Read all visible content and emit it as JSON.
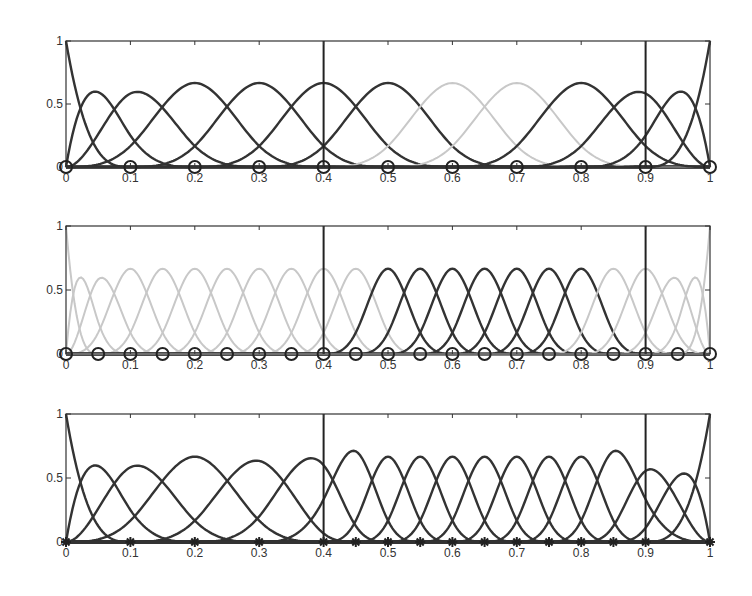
{
  "chart_data": [
    {
      "type": "line",
      "title": "",
      "subtitle": "Cubic B-spline basis, knots spaced 0.1",
      "xlabel": "",
      "ylabel": "",
      "xlim": [
        0,
        1
      ],
      "ylim": [
        0,
        1
      ],
      "x_ticks": [
        "0",
        "0.1",
        "0.2",
        "0.3",
        "0.4",
        "0.5",
        "0.6",
        "0.7",
        "0.8",
        "0.9",
        "1"
      ],
      "y_ticks": [
        "0",
        "0.5",
        "1"
      ],
      "spline_order": 4,
      "interior_knots": [
        0.1,
        0.2,
        0.3,
        0.4,
        0.5,
        0.6,
        0.7,
        0.8,
        0.9
      ],
      "knot_markers": [
        0,
        0.1,
        0.2,
        0.3,
        0.4,
        0.5,
        0.6,
        0.7,
        0.8,
        0.9,
        1
      ],
      "marker": "circle",
      "vertical_lines": [
        0.4,
        0.9
      ],
      "highlight_light_basis_peaks": [
        0.6,
        0.7
      ],
      "series_color_dark": "#333333",
      "series_color_light": "#c8c8c8",
      "grid": false
    },
    {
      "type": "line",
      "title": "",
      "subtitle": "Cubic B-spline basis, knots spaced 0.05, subset highlighted",
      "xlabel": "",
      "ylabel": "",
      "xlim": [
        0,
        1
      ],
      "ylim": [
        0,
        1
      ],
      "x_ticks": [
        "0",
        "0.1",
        "0.2",
        "0.3",
        "0.4",
        "0.5",
        "0.6",
        "0.7",
        "0.8",
        "0.9",
        "1"
      ],
      "y_ticks": [
        "0",
        "0.5",
        "1"
      ],
      "spline_order": 4,
      "interior_knots": [
        0.05,
        0.1,
        0.15,
        0.2,
        0.25,
        0.3,
        0.35,
        0.4,
        0.45,
        0.5,
        0.55,
        0.6,
        0.65,
        0.7,
        0.75,
        0.8,
        0.85,
        0.9,
        0.95
      ],
      "knot_markers": [
        0,
        0.05,
        0.1,
        0.15,
        0.2,
        0.25,
        0.3,
        0.35,
        0.4,
        0.45,
        0.5,
        0.55,
        0.6,
        0.65,
        0.7,
        0.75,
        0.8,
        0.85,
        0.9,
        0.95,
        1
      ],
      "marker": "circle",
      "vertical_lines": [
        0.4,
        0.9
      ],
      "highlight_dark_basis_peaks": [
        0.5,
        0.55,
        0.6,
        0.65,
        0.7,
        0.75,
        0.8
      ],
      "series_color_dark": "#333333",
      "series_color_light": "#c8c8c8",
      "grid": false
    },
    {
      "type": "line",
      "title": "",
      "subtitle": "Cubic B-spline basis after local knot refinement",
      "xlabel": "",
      "ylabel": "",
      "xlim": [
        0,
        1
      ],
      "ylim": [
        0,
        1
      ],
      "x_ticks": [
        "0",
        "0.1",
        "0.2",
        "0.3",
        "0.4",
        "0.5",
        "0.6",
        "0.7",
        "0.8",
        "0.9",
        "1"
      ],
      "y_ticks": [
        "0",
        "0.5",
        "1"
      ],
      "spline_order": 4,
      "interior_knots": [
        0.1,
        0.2,
        0.3,
        0.4,
        0.45,
        0.5,
        0.55,
        0.6,
        0.65,
        0.7,
        0.75,
        0.8,
        0.85,
        0.9
      ],
      "knot_markers": [
        0,
        0.1,
        0.2,
        0.3,
        0.4,
        0.45,
        0.5,
        0.55,
        0.6,
        0.65,
        0.7,
        0.75,
        0.8,
        0.85,
        0.9,
        1
      ],
      "marker": "star",
      "vertical_lines": [
        0.4,
        0.9
      ],
      "series_color_dark": "#333333",
      "grid": false
    }
  ]
}
